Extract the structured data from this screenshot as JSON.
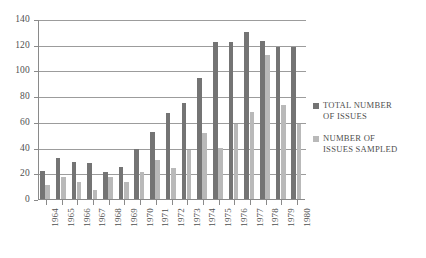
{
  "chart_data": {
    "type": "bar",
    "title": "",
    "subtitle": "",
    "xlabel": "",
    "ylabel": "",
    "ylim": [
      0,
      140
    ],
    "yticks": [
      0,
      20,
      40,
      60,
      80,
      100,
      120,
      140
    ],
    "grid": true,
    "legend_position": "right",
    "categories": [
      "1964",
      "1965",
      "1966",
      "1967",
      "1968",
      "1969",
      "1970",
      "1971",
      "1972",
      "1973",
      "1974",
      "1975",
      "1976",
      "1977",
      "1978",
      "1979",
      "1980"
    ],
    "series": [
      {
        "name": "TOTAL NUMBER OF ISSUES",
        "color": "#747474",
        "values": [
          22,
          32,
          29,
          28,
          21,
          25,
          39,
          52,
          67,
          75,
          94,
          122,
          122,
          130,
          123,
          118,
          118
        ]
      },
      {
        "name": "NUMBER OF ISSUES SAMPLED",
        "color": "#b9b9b9",
        "values": [
          11,
          17,
          13,
          7,
          17,
          13,
          21,
          30,
          24,
          38,
          51,
          40,
          58,
          68,
          112,
          73,
          58
        ]
      }
    ]
  },
  "legend": {
    "entries": [
      {
        "label_line1": "TOTAL NUMBER",
        "label_line2": "OF ISSUES",
        "swatch": "total"
      },
      {
        "label_line1": "NUMBER OF",
        "label_line2": "ISSUES SAMPLED",
        "swatch": "sampled"
      }
    ]
  },
  "axis": {
    "y_tick_labels": [
      "140",
      "120",
      "100",
      "80",
      "60",
      "40",
      "20",
      "0"
    ],
    "x_tick_labels": [
      "1964",
      "1965",
      "1966",
      "1967",
      "1968",
      "1969",
      "1970",
      "1971",
      "1972",
      "1973",
      "1974",
      "1975",
      "1976",
      "1977",
      "1978",
      "1979",
      "1980"
    ]
  }
}
